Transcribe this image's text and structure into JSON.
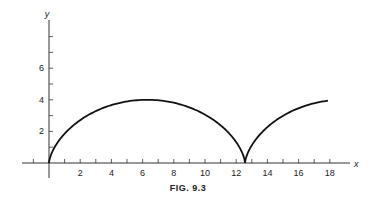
{
  "caption": "FIG. 9.3",
  "chart_data": {
    "type": "line",
    "title": "",
    "xlabel": "x",
    "ylabel": "y",
    "x_ticks": [
      2,
      4,
      6,
      8,
      10,
      12,
      14,
      16,
      18
    ],
    "y_ticks": [
      2,
      4,
      6
    ],
    "xlim": [
      -2,
      19.5
    ],
    "ylim": [
      0,
      8.2
    ],
    "grid": false,
    "series": [
      {
        "name": "cycloid",
        "x": [
          0,
          0.36,
          1.07,
          2.36,
          4.2,
          6.28,
          8.36,
          10.2,
          11.5,
          12.21,
          12.57,
          12.93,
          13.64,
          14.93,
          16.77,
          17.9
        ],
        "y": [
          0,
          0.54,
          1.38,
          2.44,
          3.41,
          4.0,
          3.41,
          2.44,
          1.38,
          0.54,
          0,
          0.54,
          1.38,
          2.44,
          3.41,
          3.75
        ]
      }
    ]
  }
}
